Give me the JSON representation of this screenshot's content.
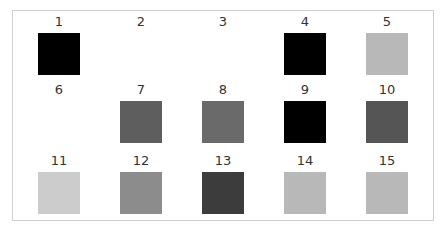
{
  "grid": {
    "rows": 3,
    "columns": 5,
    "items": [
      {
        "label": "1",
        "color": "#000000"
      },
      {
        "label": "2",
        "color": "#ffffff"
      },
      {
        "label": "3",
        "color": "#ffffff"
      },
      {
        "label": "4",
        "color": "#000000"
      },
      {
        "label": "5",
        "color": "#b8b8b8"
      },
      {
        "label": "6",
        "color": "#ffffff"
      },
      {
        "label": "7",
        "color": "#5e5e5e"
      },
      {
        "label": "8",
        "color": "#6a6a6a"
      },
      {
        "label": "9",
        "color": "#000000"
      },
      {
        "label": "10",
        "color": "#555555"
      },
      {
        "label": "11",
        "color": "#cccccc"
      },
      {
        "label": "12",
        "color": "#8c8c8c"
      },
      {
        "label": "13",
        "color": "#3c3c3c"
      },
      {
        "label": "14",
        "color": "#b8b8b8"
      },
      {
        "label": "15",
        "color": "#b8b8b8"
      }
    ]
  }
}
